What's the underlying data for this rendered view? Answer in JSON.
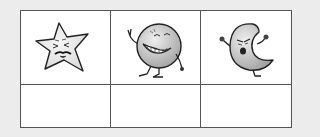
{
  "worksheet": {
    "table": {
      "columns": 3,
      "rows": [
        {
          "type": "images",
          "cells": [
            {
              "icon": "star-character-icon",
              "description": "Cartoon star with a squinting, grumpy face"
            },
            {
              "icon": "round-moon-character-icon",
              "description": "Cartoon round moon with a big grin making a peace sign"
            },
            {
              "icon": "crescent-moon-character-icon",
              "description": "Cartoon crescent moon with an angry face and raised fists"
            }
          ]
        },
        {
          "type": "answers",
          "cells": [
            {
              "value": ""
            },
            {
              "value": ""
            },
            {
              "value": ""
            }
          ]
        }
      ]
    },
    "colors": {
      "background": "#ececec",
      "table_fill": "#ffffff",
      "border": "#3a3a3a",
      "character_fill": "#d8d8d8",
      "outline": "#222222"
    }
  }
}
